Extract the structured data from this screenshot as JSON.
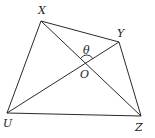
{
  "diagram": {
    "type": "quadrilateral-with-diagonals",
    "vertices": {
      "X": {
        "label": "X",
        "x": 41,
        "y": 21,
        "label_x": 38,
        "label_y": 14
      },
      "Y": {
        "label": "Y",
        "x": 119,
        "y": 42,
        "label_x": 117,
        "label_y": 37
      },
      "Z": {
        "label": "Z",
        "x": 141,
        "y": 116,
        "label_x": 135,
        "label_y": 130
      },
      "U": {
        "label": "U",
        "x": 7,
        "y": 113,
        "label_x": 4,
        "label_y": 127
      }
    },
    "intersection": {
      "label": "O",
      "x": 87,
      "y": 63,
      "label_x": 80,
      "label_y": 78
    },
    "angle": {
      "label": "θ",
      "x": 83,
      "y": 53
    },
    "edges": [
      [
        "X",
        "Y"
      ],
      [
        "Y",
        "Z"
      ],
      [
        "Z",
        "U"
      ],
      [
        "U",
        "X"
      ]
    ],
    "diagonals": [
      [
        "X",
        "Z"
      ],
      [
        "U",
        "Y"
      ]
    ],
    "stroke_color": "#2a2a2a"
  }
}
